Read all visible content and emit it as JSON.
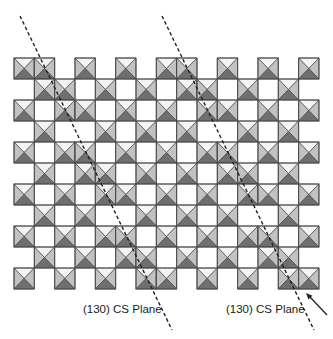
{
  "diagram": {
    "type": "crystal-structure",
    "grid": {
      "x0": 14,
      "y0": 58,
      "cell_w": 20.33,
      "cell_h": 21,
      "columns": 15,
      "rows": [
        [
          0,
          1,
          3,
          5,
          7,
          8,
          10,
          12,
          14
        ],
        [
          1,
          2,
          4,
          6,
          8,
          9,
          11,
          13
        ],
        [
          0,
          2,
          3,
          5,
          7,
          9,
          10,
          12,
          14
        ],
        [
          1,
          4,
          6,
          8,
          11,
          13
        ],
        [
          0,
          2,
          3,
          5,
          7,
          9,
          10,
          12,
          14
        ],
        [
          1,
          3,
          4,
          6,
          8,
          10,
          11,
          13
        ],
        [
          0,
          2,
          4,
          5,
          7,
          9,
          11,
          12,
          14
        ],
        [
          1,
          3,
          6,
          8,
          10,
          13
        ],
        [
          0,
          2,
          4,
          5,
          7,
          9,
          11,
          12,
          14
        ],
        [
          1,
          3,
          5,
          6,
          8,
          10,
          12,
          13
        ],
        [
          0,
          2,
          4,
          6,
          7,
          9,
          11,
          13,
          14
        ]
      ]
    },
    "octahedron_colors": {
      "top": "#f4f4f4",
      "sides": "#c2c2c2",
      "bottom": "#6f6f6f",
      "outline": "#4a4a4a"
    },
    "shear_planes": [
      {
        "label": "(130) CS Plane",
        "x1": 20,
        "y1": 16,
        "x2": 172,
        "y2": 330,
        "label_x": 83,
        "label_y": 303
      },
      {
        "label": "(130) CS Plane",
        "x1": 162,
        "y1": 16,
        "x2": 314,
        "y2": 330,
        "label_x": 226,
        "label_y": 303
      }
    ],
    "arrow": {
      "x1": 327,
      "y1": 315,
      "x2": 306,
      "y2": 293,
      "color": "#222222"
    },
    "line_color": "#222222"
  }
}
